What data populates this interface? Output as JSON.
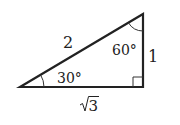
{
  "diagram": {
    "type": "right-triangle",
    "vertices": {
      "bottom_left": {
        "x": 20,
        "y": 87
      },
      "top_right": {
        "x": 143,
        "y": 14
      },
      "bottom_right": {
        "x": 143,
        "y": 87
      }
    },
    "sides": {
      "hypotenuse": "2",
      "vertical_leg": "1",
      "horizontal_leg_radicand": "3",
      "horizontal_leg_symbol": "√"
    },
    "angles": {
      "bottom_left": "30°",
      "top_right": "60°",
      "bottom_right": "right-angle"
    },
    "colors": {
      "stroke": "#222222",
      "background": "#ffffff"
    }
  }
}
